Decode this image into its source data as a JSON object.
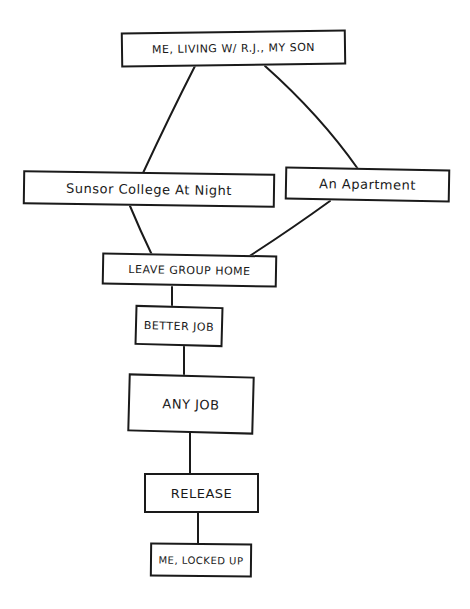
{
  "diagram": {
    "type": "hand-drawn flowchart",
    "ink_color": "#1a1a1a",
    "background": "#ffffff",
    "nodes": [
      {
        "id": "top",
        "label": "ME, LIVING W/ R.J., MY SON"
      },
      {
        "id": "sunsor",
        "label": "Sunsor College At Night"
      },
      {
        "id": "apt",
        "label": "An Apartment"
      },
      {
        "id": "leave",
        "label": "LEAVE GROUP HOME"
      },
      {
        "id": "better",
        "label": "BETTER JOB"
      },
      {
        "id": "any",
        "label": "ANY JOB"
      },
      {
        "id": "release",
        "label": "RELEASE"
      },
      {
        "id": "locked",
        "label": "ME, LOCKED UP"
      }
    ],
    "edges": [
      {
        "from": "top",
        "to": "sunsor"
      },
      {
        "from": "top",
        "to": "apt"
      },
      {
        "from": "sunsor",
        "to": "leave"
      },
      {
        "from": "apt",
        "to": "leave"
      },
      {
        "from": "leave",
        "to": "better"
      },
      {
        "from": "better",
        "to": "any"
      },
      {
        "from": "any",
        "to": "release"
      },
      {
        "from": "release",
        "to": "locked"
      }
    ]
  }
}
